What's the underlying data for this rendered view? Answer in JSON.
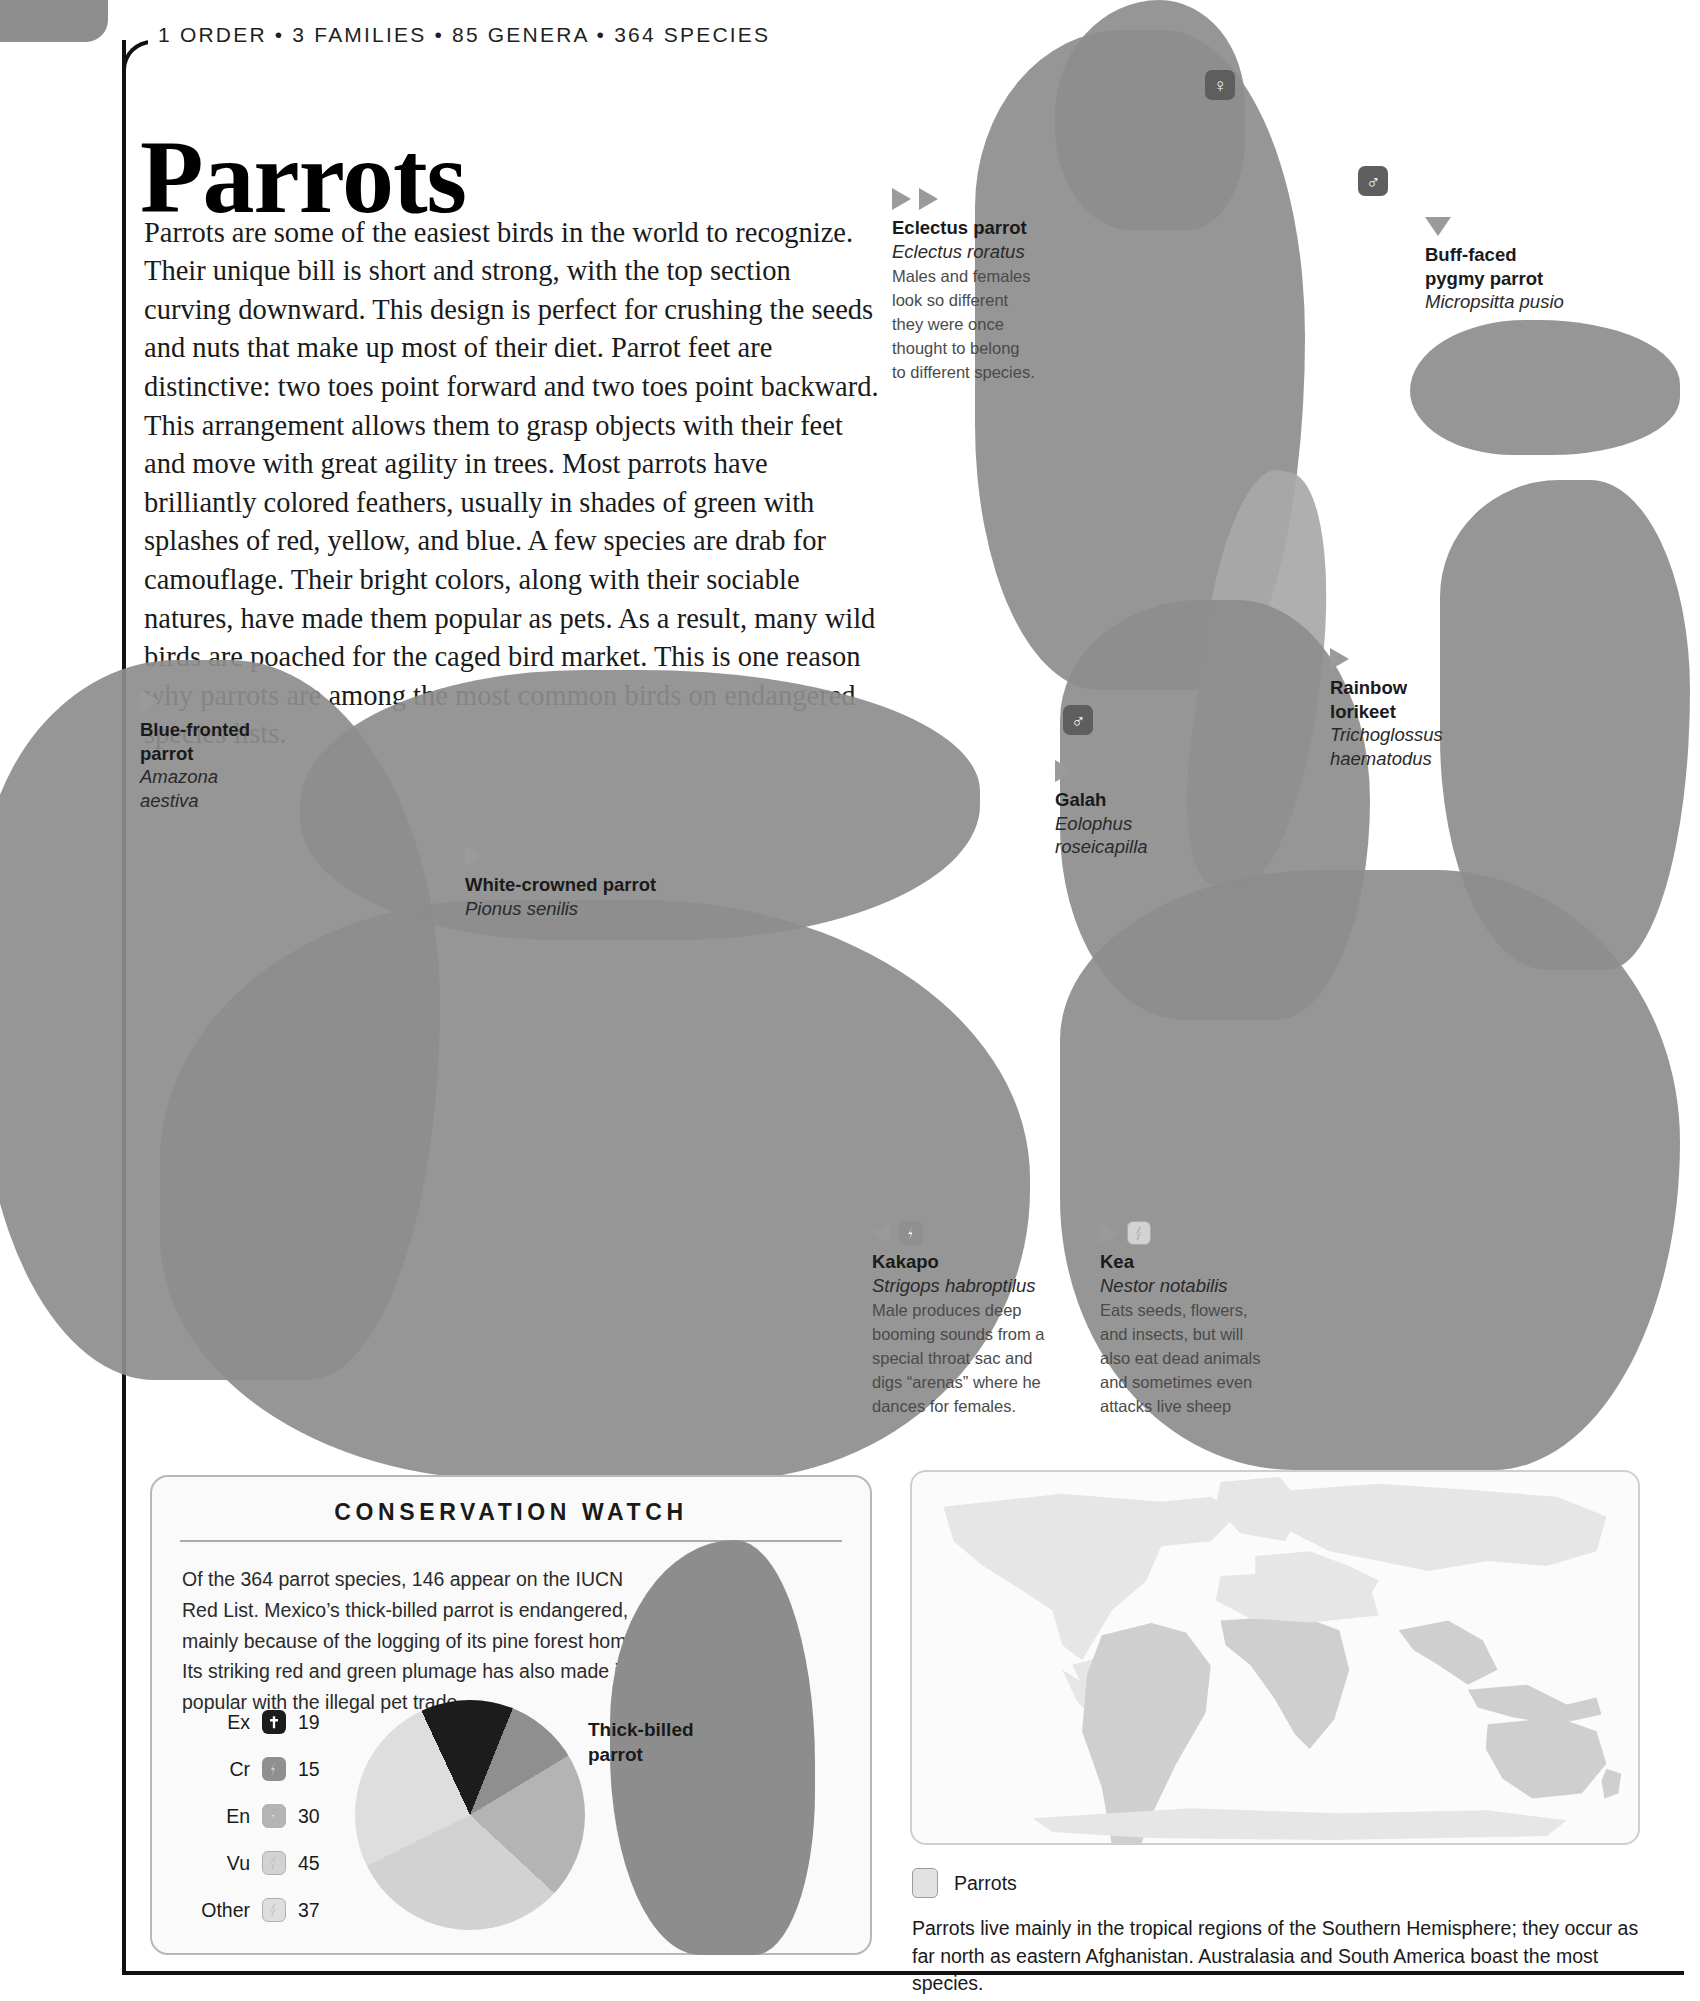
{
  "header": {
    "eyebrow": "1 ORDER • 3 FAMILIES • 85 GENERA • 364 SPECIES",
    "title": "Parrots"
  },
  "intro": {
    "text": "Parrots are some of the easiest birds in the world to recognize. Their unique bill is short and strong, with the top section curving downward. This design is perfect for crushing the seeds and nuts that make up most of their diet. Parrot feet are distinctive: two toes point forward and two toes point backward. This arrangement allows them to grasp objects with their feet and move with great agility in trees. Most parrots have brilliantly colored feathers, usually in shades of green with splashes of red, yellow, and blue. A few species are drab for camouflage. Their bright colors, along with their sociable natures, have made them popular as pets. As a result, many wild birds are poached for the caged bird market. This is one reason why parrots are among the most common birds on endangered species lists."
  },
  "gender_badges": {
    "female": "♀",
    "male": "♂"
  },
  "captions": {
    "eclectus": {
      "common": "Eclectus parrot",
      "sci": "Eclectus roratus",
      "note": "Males and females look so different they were once thought to belong to different species."
    },
    "buff_faced": {
      "common_l1": "Buff-faced",
      "common_l2": "pygmy parrot",
      "sci": "Micropsitta pusio"
    },
    "blue_fronted": {
      "common_l1": "Blue-fronted",
      "common_l2": "parrot",
      "sci_l1": "Amazona",
      "sci_l2": "aestiva"
    },
    "white_crowned": {
      "common": "White-crowned parrot",
      "sci": "Pionus senilis"
    },
    "galah": {
      "common": "Galah",
      "sci_l1": "Eolophus",
      "sci_l2": "roseicapilla"
    },
    "rainbow_lorikeet": {
      "common_l1": "Rainbow",
      "common_l2": "lorikeet",
      "sci_l1": "Trichoglossus",
      "sci_l2": "haematodus"
    },
    "kakapo": {
      "common": "Kakapo",
      "sci": "Strigops habroptilus",
      "note": "Male produces deep booming sounds from a special throat sac and digs “arenas” where he dances for females.",
      "status": "Cr"
    },
    "kea": {
      "common": "Kea",
      "sci": "Nestor notabilis",
      "note": "Eats seeds, flowers, and insects, but will also eat dead animals and sometimes even attacks live sheep",
      "status": "Vu"
    }
  },
  "conservation_watch": {
    "title": "CONSERVATION WATCH",
    "body": "Of the 364 parrot species, 146 appear on the IUCN Red List. Mexico’s thick-billed parrot is endangered, mainly because of the logging of its pine forest home. Its striking red and green plumage has also made it popular with the illegal pet trade.",
    "bird_label_l1": "Thick-billed",
    "bird_label_l2": "parrot"
  },
  "chart_data": {
    "type": "pie",
    "categories": [
      "Ex",
      "Cr",
      "En",
      "Vu",
      "Other"
    ],
    "values": [
      19,
      15,
      30,
      45,
      37
    ],
    "colors": [
      "#1c1c1c",
      "#8f8f8f",
      "#b4b4b4",
      "#d2d2d2",
      "#dedede"
    ],
    "total": 146,
    "legend_position": "left",
    "labels_shown": true
  },
  "map": {
    "key_label": "Parrots",
    "caption": "Parrots live mainly in the tropical regions of the Southern Hemisphere; they occur as far north as eastern Afghanistan. Australasia and South America boast the most species.",
    "range_color": "#cfcfcf"
  },
  "colors": {
    "marker": "#9a9a9a",
    "rule": "#111111",
    "corner_tab": "#8e8e8e"
  }
}
